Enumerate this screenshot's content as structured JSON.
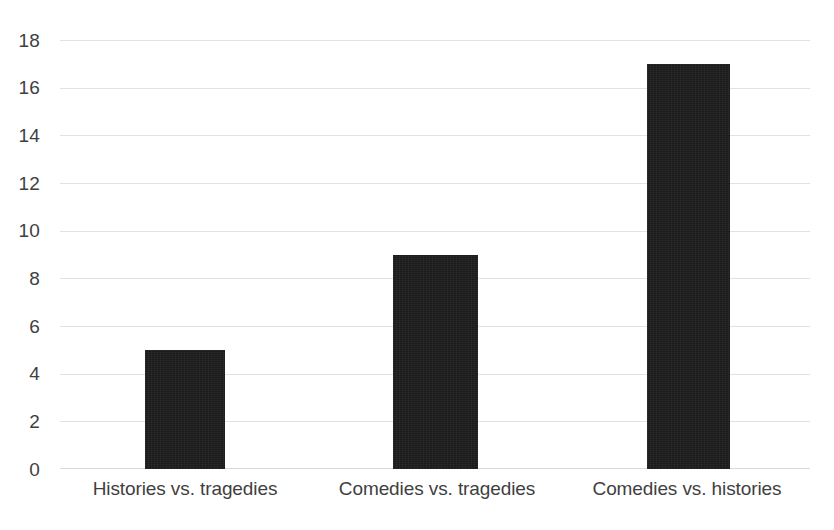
{
  "chart_data": {
    "type": "bar",
    "title": "",
    "subtitle": "",
    "xlabel": "",
    "ylabel": "",
    "categories": [
      "Histories vs. tragedies",
      "Comedies vs. tragedies",
      "Comedies vs. histories"
    ],
    "values": [
      5,
      9,
      17
    ],
    "ylim": [
      0,
      18
    ],
    "ytick_step": 2,
    "yticks": [
      0,
      2,
      4,
      6,
      8,
      10,
      12,
      14,
      16,
      18
    ],
    "ytick_labels": [
      "0",
      "2",
      "4",
      "6",
      "8",
      "10",
      "12",
      "14",
      "16",
      "18"
    ],
    "grid": true,
    "grid_axis": "y",
    "legend": false,
    "legend_position": "none",
    "bar_color": "#1b1b1b",
    "gridline_color": "#e2e2e2",
    "tick_label_color": "#3f3f3f",
    "background_color": "#ffffff"
  }
}
